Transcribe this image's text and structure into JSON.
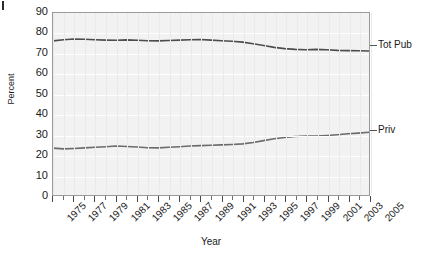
{
  "chart_data": {
    "type": "line",
    "title": "",
    "xlabel": "Year",
    "ylabel": "Percent",
    "ylim": [
      0,
      90
    ],
    "ytick_step": 10,
    "yticks": [
      "90",
      "80",
      "70",
      "60",
      "50",
      "40",
      "30",
      "20",
      "10",
      "0"
    ],
    "xlim": [
      1975,
      2005
    ],
    "x": [
      1975,
      1976,
      1977,
      1978,
      1979,
      1980,
      1981,
      1982,
      1983,
      1984,
      1985,
      1986,
      1987,
      1988,
      1989,
      1990,
      1991,
      1992,
      1993,
      1994,
      1995,
      1996,
      1997,
      1998,
      1999,
      2000,
      2001,
      2002,
      2003,
      2004,
      2005
    ],
    "xtick_labels": [
      "1975",
      "1977",
      "1979",
      "1981",
      "1983",
      "1985",
      "1987",
      "1989",
      "1991",
      "1993",
      "1995",
      "1997",
      "1999",
      "2001",
      "2003",
      "2005"
    ],
    "xtick_label_years": [
      1975,
      1977,
      1979,
      1981,
      1983,
      1985,
      1987,
      1989,
      1991,
      1993,
      1995,
      1997,
      1999,
      2001,
      2003,
      2005
    ],
    "grid": "horizontal-white-on-gray",
    "legend_position": "right-inline",
    "series": [
      {
        "name": "Tot Pub",
        "color": "#4d4d4d",
        "label_x_year": 2005,
        "values": [
          76.2,
          76.8,
          77.1,
          77.0,
          76.8,
          76.6,
          76.5,
          76.7,
          76.5,
          76.3,
          76.2,
          76.4,
          76.6,
          76.8,
          76.9,
          76.6,
          76.3,
          76.0,
          75.6,
          74.8,
          73.9,
          73.0,
          72.4,
          72.0,
          71.8,
          72.0,
          71.8,
          71.5,
          71.4,
          71.3,
          71.2
        ]
      },
      {
        "name": "Priv",
        "color": "#6b6b6b",
        "label_x_year": 2005,
        "values": [
          23.2,
          22.8,
          23.0,
          23.3,
          23.6,
          23.9,
          24.2,
          24.0,
          23.7,
          23.4,
          23.3,
          23.6,
          23.9,
          24.2,
          24.4,
          24.6,
          24.8,
          25.0,
          25.3,
          26.0,
          26.9,
          27.8,
          28.4,
          28.9,
          29.2,
          29.1,
          29.4,
          29.8,
          30.3,
          30.6,
          31.0
        ]
      }
    ]
  }
}
